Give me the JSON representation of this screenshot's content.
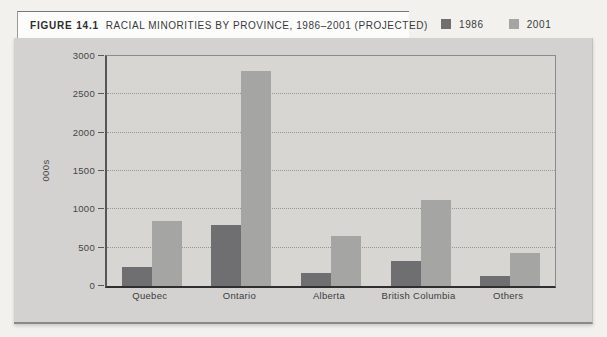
{
  "figure": {
    "label": "FIGURE 14.1",
    "title": "RACIAL MINORITIES BY PROVINCE, 1986–2001 (PROJECTED)"
  },
  "legend": {
    "items": [
      {
        "label": "1986",
        "color": "#6f6f71"
      },
      {
        "label": "2001",
        "color": "#a5a5a3"
      }
    ]
  },
  "chart_data": {
    "type": "bar",
    "title": "RACIAL MINORITIES BY PROVINCE, 1986–2001 (PROJECTED)",
    "categories": [
      "Quebec",
      "Ontario",
      "Alberta",
      "British Columbia",
      "Others"
    ],
    "series": [
      {
        "name": "1986",
        "color": "#6f6f71",
        "values": [
          250,
          800,
          175,
          325,
          125
        ]
      },
      {
        "name": "2001",
        "color": "#a5a5a3",
        "values": [
          850,
          2800,
          650,
          1125,
          425
        ]
      }
    ],
    "xlabel": "",
    "ylabel": "000s",
    "ylim": [
      0,
      3000
    ],
    "yticks": [
      0,
      500,
      1000,
      1500,
      2000,
      2500,
      3000
    ],
    "grid": "horizontal-dotted",
    "legend_position": "top-right-outside"
  }
}
